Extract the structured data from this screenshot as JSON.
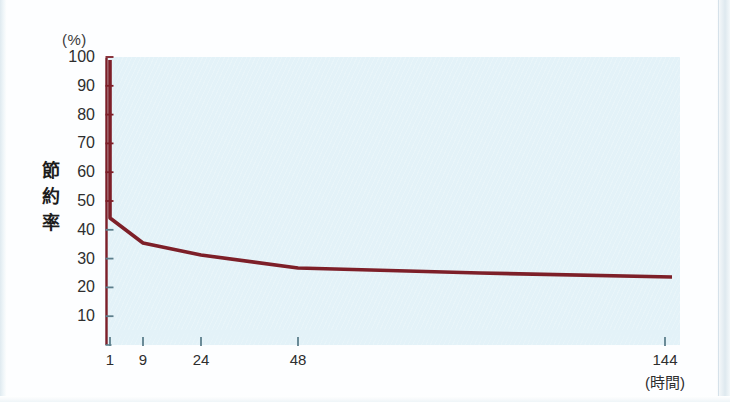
{
  "chart_data": {
    "type": "line",
    "title": "",
    "subtitle": "",
    "xlabel": "(時間)",
    "ylabel": "節約率",
    "yunit": "(%)",
    "xlim": [
      0,
      152
    ],
    "ylim": [
      0,
      100
    ],
    "grid": false,
    "legend": "none",
    "line_color": "#7d1f28",
    "plot_background": "#e3f2f8",
    "page_background": "#ffffff",
    "x_ticks": [
      {
        "value": 1,
        "label": "1",
        "px": 110
      },
      {
        "value": 9,
        "label": "9",
        "px": 143
      },
      {
        "value": 24,
        "label": "24",
        "px": 201
      },
      {
        "value": 48,
        "label": "48",
        "px": 298
      },
      {
        "value": 144,
        "label": "144",
        "px": 665
      }
    ],
    "y_ticks": [
      {
        "value": 100,
        "label": "100"
      },
      {
        "value": 90,
        "label": "90"
      },
      {
        "value": 80,
        "label": "80"
      },
      {
        "value": 70,
        "label": "70"
      },
      {
        "value": 60,
        "label": "60"
      },
      {
        "value": 50,
        "label": "50"
      },
      {
        "value": 40,
        "label": "40"
      },
      {
        "value": 30,
        "label": "30"
      },
      {
        "value": 20,
        "label": "20"
      },
      {
        "value": 10,
        "label": "10"
      }
    ],
    "series": [
      {
        "name": "節約率",
        "color": "#7d1f28",
        "points": [
          {
            "x": 1,
            "y": 100,
            "px": 110,
            "py": 60
          },
          {
            "x": 1,
            "y": 45,
            "px": 110,
            "py": 218
          },
          {
            "x": 9,
            "y": 36,
            "px": 143,
            "py": 243
          },
          {
            "x": 24,
            "y": 32,
            "px": 201,
            "py": 255
          },
          {
            "x": 48,
            "y": 28.5,
            "px": 298,
            "py": 268
          },
          {
            "x": 96,
            "y": 26.5,
            "px": 480,
            "py": 273
          },
          {
            "x": 144,
            "y": 25,
            "px": 672,
            "py": 277
          }
        ]
      }
    ],
    "ylabel_chars": [
      "節",
      "約",
      "率"
    ]
  },
  "yaxis": {
    "unit": "(%)",
    "title_chars": [
      "節",
      "約",
      "率"
    ]
  },
  "xaxis": {
    "unit": "(時間)"
  }
}
